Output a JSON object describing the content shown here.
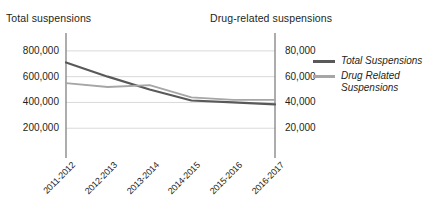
{
  "axis_titles": {
    "left": "Total suspensions",
    "right": "Drug-related suspensions"
  },
  "legend": {
    "items": [
      {
        "label": "Total Suspensions",
        "color": "#595959"
      },
      {
        "label": "Drug Related Suspensions",
        "color": "#a6a6a6"
      }
    ]
  },
  "colors": {
    "total_line": "#595959",
    "drug_line": "#a6a6a6",
    "gridline": "#d9d9d9",
    "axis": "#808080",
    "text": "#231f20",
    "background": "#ffffff"
  },
  "chart_data": {
    "type": "line",
    "title": "",
    "xlabel": "",
    "ylabel": "Total suspensions",
    "y2label": "Drug-related suspensions",
    "categories": [
      "2011-2012",
      "2012-2013",
      "2013-2014",
      "2014-2015",
      "2015-2016",
      "2016-2017"
    ],
    "ylim": [
      0,
      900000
    ],
    "y2lim": [
      0,
      90000
    ],
    "yticks": [
      "200,000",
      "400,000",
      "600,000",
      "800,000"
    ],
    "ytick_values": [
      200000,
      400000,
      600000,
      800000
    ],
    "y2ticks": [
      "20,000",
      "40,000",
      "60,000",
      "80,000"
    ],
    "y2tick_values": [
      20000,
      40000,
      60000,
      80000
    ],
    "grid": true,
    "legend_position": "right",
    "series": [
      {
        "name": "Total Suspensions",
        "axis": "left",
        "color": "#595959",
        "values": [
          710000,
          600000,
          500000,
          415000,
          400000,
          385000
        ]
      },
      {
        "name": "Drug Related Suspensions",
        "axis": "right",
        "color": "#a6a6a6",
        "values": [
          55000,
          52000,
          53500,
          44000,
          42000,
          42000
        ]
      }
    ]
  }
}
